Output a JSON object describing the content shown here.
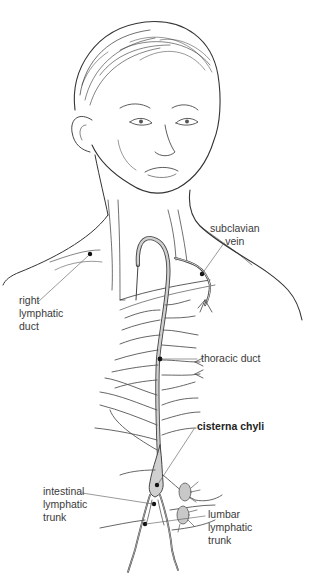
{
  "diagram": {
    "colors": {
      "ink": "#333333",
      "vessel_fill": "#d0d0d0",
      "node_fill": "#c8c8c8",
      "label_text": "#3a3a3a",
      "leader": "#555555",
      "background": "#ffffff"
    },
    "labels": {
      "subclavian_vein": {
        "line1": "subclavian",
        "line2": "vein"
      },
      "right_lymphatic_duct": {
        "line1": "right",
        "line2": "lymphatic",
        "line3": "duct"
      },
      "thoracic_duct": {
        "line1": "thoracic duct"
      },
      "cisterna_chyli": {
        "line1": "cisterna chyli"
      },
      "intestinal_lymphatic_trunk": {
        "line1": "intestinal",
        "line2": "lymphatic",
        "line3": "trunk"
      },
      "lumbar_lymphatic_trunk": {
        "line1": "lumbar",
        "line2": "lymphatic",
        "line3": "trunk"
      }
    }
  }
}
